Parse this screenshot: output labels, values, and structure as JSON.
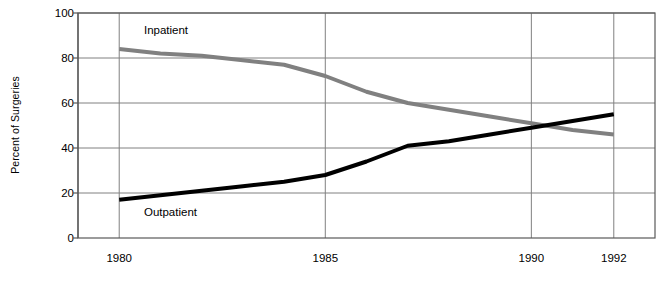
{
  "chart_data": {
    "type": "line",
    "title": "",
    "xlabel": "",
    "ylabel": "Percent of Surgeries",
    "xlim": [
      1979,
      1993
    ],
    "ylim": [
      0,
      100
    ],
    "ytick_values": [
      0,
      20,
      40,
      60,
      80,
      100
    ],
    "ytick_labels": [
      "0",
      "20",
      "40",
      "60",
      "80",
      "100"
    ],
    "xtick_values": [
      1980,
      1985,
      1990,
      1992
    ],
    "xtick_labels": [
      "1980",
      "1985",
      "1990",
      "1992"
    ],
    "grid": true,
    "legend_position": "inline-annotations",
    "x": [
      1980,
      1981,
      1982,
      1983,
      1984,
      1985,
      1986,
      1987,
      1988,
      1989,
      1990,
      1991,
      1992
    ],
    "series": [
      {
        "name": "Inpatient",
        "color": "#808080",
        "label_x": 1980.6,
        "label_y": 92,
        "values": [
          84,
          82,
          81,
          79,
          77,
          72,
          65,
          60,
          57,
          54,
          51,
          48,
          46
        ]
      },
      {
        "name": "Outpatient",
        "color": "#000000",
        "label_x": 1980.6,
        "label_y": 11,
        "values": [
          17,
          19,
          21,
          23,
          25,
          28,
          34,
          41,
          43,
          46,
          49,
          52,
          55
        ]
      }
    ]
  },
  "axes": {
    "frame_color": "#595959",
    "grid_color": "#808080"
  }
}
